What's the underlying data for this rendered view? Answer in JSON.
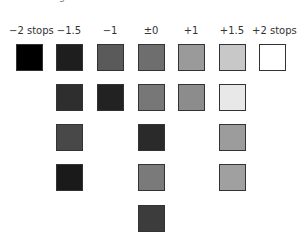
{
  "caption": "...bracketing in action",
  "columns": [
    {
      "label": "−2 stops",
      "x": 16,
      "swatches": [
        "#000000"
      ]
    },
    {
      "label": "−1.5",
      "x": 56,
      "swatches": [
        "#1e1e1e",
        "#2e2e2e",
        "#484848",
        "#1a1a1a"
      ]
    },
    {
      "label": "−1",
      "x": 97,
      "swatches": [
        "#5a5a5a",
        "#222222"
      ]
    },
    {
      "label": "±0",
      "x": 138,
      "swatches": [
        "#6e6e6e",
        "#777777",
        "#2a2a2a",
        "#7a7a7a",
        "#3c3c3c"
      ]
    },
    {
      "label": "+1",
      "x": 178,
      "swatches": [
        "#9a9a9a",
        "#8c8c8c"
      ]
    },
    {
      "label": "+1.5",
      "x": 219,
      "swatches": [
        "#c8c8c8",
        "#e8e8e8",
        "#9c9c9c",
        "#a0a0a0"
      ]
    },
    {
      "label": "+2 stops",
      "x": 259,
      "swatches": [
        "#ffffff"
      ]
    }
  ],
  "row_y": [
    44,
    84,
    124,
    164,
    205
  ]
}
